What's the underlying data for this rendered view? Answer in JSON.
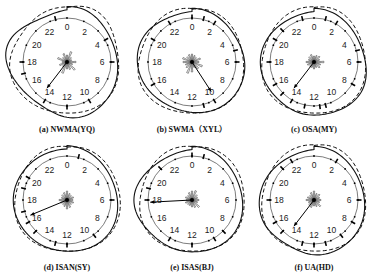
{
  "figure": {
    "hour_labels": [
      "0",
      "2",
      "4",
      "6",
      "8",
      "10",
      "12",
      "14",
      "16",
      "18",
      "20",
      "22"
    ],
    "panels": [
      {
        "id": "a",
        "caption": "(a) NWMA(YQ)",
        "arrow_hour": 14.5,
        "arrow_len": 0.75,
        "rose": [
          0.35,
          0.55,
          0.3,
          0.25,
          0.45,
          0.3,
          0.55,
          0.4,
          0.35,
          0.6,
          0.3,
          0.4,
          0.25,
          0.5,
          0.3,
          0.45
        ],
        "solid_bumps": [
          [
            19,
            0.2
          ],
          [
            11.5,
            0.12
          ],
          [
            1,
            0.05
          ]
        ],
        "dashed_bumps": [
          [
            18,
            0.12
          ],
          [
            2,
            0.1
          ]
        ],
        "ticks": [
          23,
          4,
          6,
          10,
          12,
          14,
          17,
          18
        ]
      },
      {
        "id": "b",
        "caption": "(b) SWMA（XYL）",
        "arrow_hour": 9.8,
        "arrow_len": 0.8,
        "rose": [
          0.4,
          0.35,
          0.3,
          0.45,
          0.35,
          0.55,
          0.45,
          0.3,
          0.5,
          0.6,
          0.4,
          0.35,
          0.45,
          0.5,
          0.35,
          0.4
        ],
        "solid_bumps": [
          [
            20,
            0.06
          ],
          [
            6,
            0.05
          ]
        ],
        "dashed_bumps": [
          [
            17,
            0.04
          ]
        ],
        "ticks": [
          0,
          1,
          2,
          5,
          6,
          10,
          11,
          16,
          20,
          22
        ]
      },
      {
        "id": "c",
        "caption": "(c) OSA(MY)",
        "arrow_hour": 14.5,
        "arrow_len": 0.75,
        "rose": [
          0.3,
          0.35,
          0.4,
          0.3,
          0.5,
          0.35,
          0.4,
          0.3,
          0.35,
          0.3,
          0.3,
          0.35,
          0.4,
          0.3,
          0.35,
          0.4
        ],
        "solid_bumps": [
          [
            13,
            0.08
          ],
          [
            8,
            0.06
          ]
        ],
        "dashed_bumps": [
          [
            1,
            0.05
          ]
        ],
        "ticks": [
          11,
          11.5,
          12.8,
          14,
          15,
          16,
          18,
          20,
          21,
          23,
          1,
          2,
          5,
          6,
          8
        ]
      },
      {
        "id": "d",
        "caption": "(d) ISAN(SY)",
        "arrow_hour": 16.5,
        "arrow_len": 0.9,
        "rose": [
          0.45,
          0.35,
          0.3,
          0.35,
          0.3,
          0.35,
          0.3,
          0.4,
          0.45,
          0.35,
          0.3,
          0.35,
          0.4,
          0.3,
          0.35,
          0.4
        ],
        "solid_bumps": [
          [
            22,
            0.04
          ],
          [
            14,
            0.05
          ]
        ],
        "dashed_bumps": [
          [
            6,
            0.04
          ]
        ],
        "ticks": [
          1,
          6,
          9.5,
          12,
          13,
          15,
          16,
          17,
          19,
          20
        ]
      },
      {
        "id": "e",
        "caption": "(e) ISAS(BJ)",
        "arrow_hour": 17.8,
        "arrow_len": 0.95,
        "rose": [
          0.45,
          0.5,
          0.35,
          0.3,
          0.35,
          0.3,
          0.5,
          0.4,
          0.35,
          0.3,
          0.3,
          0.35,
          0.3,
          0.35,
          0.3,
          0.4
        ],
        "solid_bumps": [
          [
            18,
            0.1
          ],
          [
            13.5,
            0.06
          ]
        ],
        "dashed_bumps": [
          [
            4,
            0.04
          ]
        ],
        "ticks": [
          0,
          1,
          9,
          10,
          12,
          14,
          18,
          19,
          21
        ]
      },
      {
        "id": "f",
        "caption": "(f) UA(HD)",
        "arrow_hour": 14.5,
        "arrow_len": 0.75,
        "rose": [
          0.45,
          0.35,
          0.4,
          0.3,
          0.35,
          0.3,
          0.45,
          0.35,
          0.3,
          0.4,
          0.35,
          0.3,
          0.4,
          0.35,
          0.3,
          0.4
        ],
        "solid_bumps": [
          [
            12,
            0.1
          ],
          [
            16,
            0.06
          ]
        ],
        "dashed_bumps": [
          [
            1,
            0.05
          ]
        ],
        "ticks": [
          2,
          6,
          8,
          9.5,
          11,
          12,
          13,
          15,
          16,
          18,
          21,
          22
        ]
      }
    ]
  }
}
